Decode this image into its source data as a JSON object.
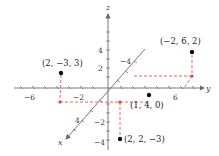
{
  "diagram": {
    "type": "3d-coordinate-plot",
    "axes": {
      "x": {
        "name": "x",
        "ticks": [
          {
            "label": "4"
          },
          {
            "label": "−4"
          }
        ]
      },
      "y": {
        "name": "y",
        "ticks": [
          {
            "label": "−6"
          },
          {
            "label": "−2"
          },
          {
            "label": "6"
          }
        ]
      },
      "z": {
        "name": "z",
        "ticks": [
          {
            "label": "4"
          },
          {
            "label": "2"
          },
          {
            "label": "−2"
          },
          {
            "label": "−4"
          }
        ]
      }
    },
    "points": [
      {
        "label": "(2, −3, 3)",
        "coords": [
          2,
          -3,
          3
        ]
      },
      {
        "label": "(−2, 6, 2)",
        "coords": [
          -2,
          6,
          2
        ]
      },
      {
        "label": "(1, 4, 0)",
        "coords": [
          1,
          4,
          0
        ]
      },
      {
        "label": "(2, 2, −3)",
        "coords": [
          2,
          2,
          -3
        ]
      }
    ],
    "colors": {
      "axis": "#6b6b6b",
      "point": "#111111",
      "projection": "#e0403a"
    }
  }
}
